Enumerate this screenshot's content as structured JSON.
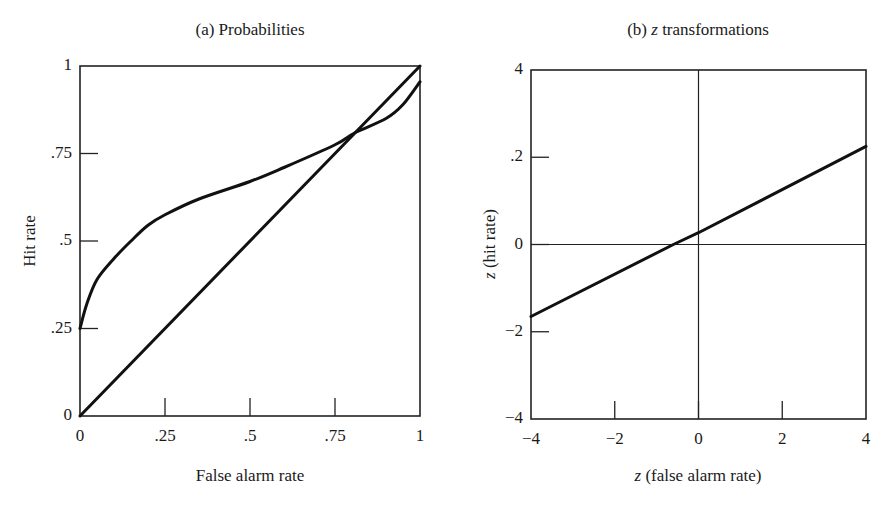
{
  "chart_data": [
    {
      "id": "a",
      "type": "line",
      "title": "(a) Probabilities",
      "xlabel": "False alarm rate",
      "ylabel": "Hit rate",
      "xlim": [
        0,
        1
      ],
      "ylim": [
        0,
        1
      ],
      "xticks": [
        0,
        0.25,
        0.5,
        0.75,
        1
      ],
      "xtick_labels": [
        "0",
        ".25",
        ".5",
        ".75",
        "1"
      ],
      "yticks": [
        0,
        0.25,
        0.5,
        0.75,
        1
      ],
      "ytick_labels": [
        "0",
        ".25",
        ".5",
        ".75",
        "1"
      ],
      "grid": false,
      "legend": null,
      "series": [
        {
          "name": "chance diagonal",
          "x": [
            0,
            1
          ],
          "y": [
            0,
            1
          ]
        },
        {
          "name": "ROC curve",
          "x": [
            0,
            0.02,
            0.05,
            0.1,
            0.15,
            0.2,
            0.25,
            0.35,
            0.5,
            0.6,
            0.75,
            0.81,
            0.9,
            0.95,
            1
          ],
          "y": [
            0.25,
            0.32,
            0.39,
            0.45,
            0.5,
            0.545,
            0.575,
            0.62,
            0.67,
            0.71,
            0.775,
            0.81,
            0.85,
            0.89,
            0.955
          ]
        }
      ],
      "annotations": [
        "curves intersect near (0.81, 0.81)"
      ]
    },
    {
      "id": "b",
      "type": "line",
      "title": "(b) z transformations",
      "title_prefix": "(b) ",
      "title_italic": "z",
      "title_suffix": " transformations",
      "xlabel": "z (false alarm rate)",
      "xlabel_italic": "z",
      "xlabel_rest": " (false alarm rate)",
      "ylabel": "z (hit rate)",
      "ylabel_italic": "z",
      "ylabel_rest": " (hit rate)",
      "xlim": [
        -4,
        4
      ],
      "ylim": [
        -4,
        4
      ],
      "xticks": [
        -4,
        -2,
        0,
        2,
        4
      ],
      "xtick_labels": [
        "−4",
        "−2",
        "0",
        "2",
        "4"
      ],
      "yticks": [
        -4,
        -2,
        0,
        2,
        4
      ],
      "ytick_labels": [
        "−4",
        "−2",
        "0",
        ".2",
        "4"
      ],
      "grid": false,
      "zero_lines": true,
      "legend": null,
      "series": [
        {
          "name": "z-transformed ROC",
          "x": [
            -4,
            -0.6,
            0,
            4
          ],
          "y": [
            -1.65,
            0,
            0.27,
            2.25
          ]
        }
      ]
    }
  ]
}
